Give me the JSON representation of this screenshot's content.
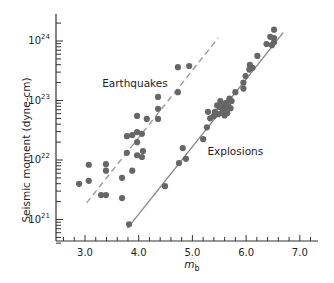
{
  "chart_data": {
    "type": "scatter",
    "title": "",
    "xlabel": "m",
    "xlabel_subscript": "b",
    "ylabel": "Seismic moment (dyne-cm)",
    "xlim": [
      2.5,
      7.35
    ],
    "ylim_log10": [
      20.5,
      24.45
    ],
    "y_scale": "log",
    "grid": false,
    "legend": "inline labels",
    "x_ticks": [
      3.0,
      4.0,
      5.0,
      6.0,
      7.0
    ],
    "x_tick_labels": [
      "3.0",
      "4.0",
      "5.0",
      "6.0",
      "7.0"
    ],
    "x_minor_step": 0.2,
    "y_ticks_log10": [
      21,
      22,
      23,
      24
    ],
    "y_tick_labels": [
      {
        "base": "10",
        "exp": "21"
      },
      {
        "base": "10",
        "exp": "22"
      },
      {
        "base": "10",
        "exp": "23"
      },
      {
        "base": "10",
        "exp": "24"
      }
    ],
    "series": [
      {
        "name": "Earthquakes",
        "label_pos": {
          "mb": 3.32,
          "log10M": 23.22
        },
        "marker": "circle",
        "color": "#666666",
        "fit_line": {
          "style": "dashed",
          "color": "#9a9a9a",
          "from": {
            "mb": 3.03,
            "log10M": 21.28
          },
          "to": {
            "mb": 5.48,
            "log10M": 24.05
          }
        },
        "points": [
          {
            "mb": 2.89,
            "log10M": 21.6
          },
          {
            "mb": 3.07,
            "log10M": 21.92
          },
          {
            "mb": 3.07,
            "log10M": 21.65
          },
          {
            "mb": 3.39,
            "log10M": 21.93
          },
          {
            "mb": 3.39,
            "log10M": 21.82
          },
          {
            "mb": 3.3,
            "log10M": 21.41
          },
          {
            "mb": 3.39,
            "log10M": 21.41
          },
          {
            "mb": 3.69,
            "log10M": 21.7
          },
          {
            "mb": 3.69,
            "log10M": 21.36
          },
          {
            "mb": 3.78,
            "log10M": 22.12
          },
          {
            "mb": 3.78,
            "log10M": 22.4
          },
          {
            "mb": 3.88,
            "log10M": 22.42
          },
          {
            "mb": 3.88,
            "log10M": 21.82
          },
          {
            "mb": 3.97,
            "log10M": 22.47
          },
          {
            "mb": 3.97,
            "log10M": 22.3
          },
          {
            "mb": 3.97,
            "log10M": 22.08
          },
          {
            "mb": 4.06,
            "log10M": 22.44
          },
          {
            "mb": 4.06,
            "log10M": 22.05
          },
          {
            "mb": 4.08,
            "log10M": 22.15
          },
          {
            "mb": 3.97,
            "log10M": 22.74
          },
          {
            "mb": 4.15,
            "log10M": 22.69
          },
          {
            "mb": 4.36,
            "log10M": 23.06
          },
          {
            "mb": 4.36,
            "log10M": 22.86
          },
          {
            "mb": 4.36,
            "log10M": 22.69
          },
          {
            "mb": 4.73,
            "log10M": 23.14
          },
          {
            "mb": 4.73,
            "log10M": 23.56
          },
          {
            "mb": 4.94,
            "log10M": 23.58
          }
        ]
      },
      {
        "name": "Explosions",
        "label_pos": {
          "mb": 5.28,
          "log10M": 22.08
        },
        "marker": "circle",
        "color": "#666666",
        "fit_line": {
          "style": "solid",
          "color": "#8a8a8a",
          "from": {
            "mb": 3.79,
            "log10M": 20.85
          },
          "to": {
            "mb": 6.69,
            "log10M": 24.14
          }
        },
        "points": [
          {
            "mb": 3.82,
            "log10M": 20.92
          },
          {
            "mb": 4.49,
            "log10M": 21.56
          },
          {
            "mb": 4.75,
            "log10M": 21.95
          },
          {
            "mb": 4.88,
            "log10M": 22.02
          },
          {
            "mb": 4.82,
            "log10M": 22.2
          },
          {
            "mb": 5.2,
            "log10M": 22.35
          },
          {
            "mb": 5.27,
            "log10M": 22.55
          },
          {
            "mb": 5.29,
            "log10M": 22.81
          },
          {
            "mb": 5.33,
            "log10M": 22.7
          },
          {
            "mb": 5.4,
            "log10M": 22.74
          },
          {
            "mb": 5.42,
            "log10M": 22.81
          },
          {
            "mb": 5.46,
            "log10M": 22.92
          },
          {
            "mb": 5.48,
            "log10M": 22.77
          },
          {
            "mb": 5.5,
            "log10M": 22.89
          },
          {
            "mb": 5.52,
            "log10M": 22.99
          },
          {
            "mb": 5.55,
            "log10M": 22.79
          },
          {
            "mb": 5.57,
            "log10M": 22.86
          },
          {
            "mb": 5.58,
            "log10M": 22.94
          },
          {
            "mb": 5.6,
            "log10M": 22.75
          },
          {
            "mb": 5.61,
            "log10M": 22.87
          },
          {
            "mb": 5.63,
            "log10M": 22.96
          },
          {
            "mb": 5.65,
            "log10M": 22.79
          },
          {
            "mb": 5.67,
            "log10M": 22.9
          },
          {
            "mb": 5.69,
            "log10M": 23.03
          },
          {
            "mb": 5.71,
            "log10M": 22.87
          },
          {
            "mb": 5.73,
            "log10M": 22.99
          },
          {
            "mb": 5.8,
            "log10M": 23.14
          },
          {
            "mb": 5.95,
            "log10M": 23.2
          },
          {
            "mb": 5.95,
            "log10M": 23.3
          },
          {
            "mb": 5.99,
            "log10M": 23.41
          },
          {
            "mb": 6.06,
            "log10M": 23.52
          },
          {
            "mb": 6.12,
            "log10M": 23.55
          },
          {
            "mb": 6.07,
            "log10M": 23.6
          },
          {
            "mb": 6.21,
            "log10M": 23.75
          },
          {
            "mb": 6.38,
            "log10M": 23.95
          },
          {
            "mb": 6.45,
            "log10M": 24.07
          },
          {
            "mb": 6.52,
            "log10M": 24.05
          },
          {
            "mb": 6.52,
            "log10M": 23.98
          },
          {
            "mb": 6.52,
            "log10M": 24.19
          },
          {
            "mb": 6.48,
            "log10M": 23.93
          }
        ]
      }
    ]
  },
  "labels": {
    "earthquakes": "Earthquakes",
    "explosions": "Explosions",
    "ylabel": "Seismic moment (dyne-cm)",
    "xlabel_main": "m",
    "xlabel_sub": "b"
  }
}
